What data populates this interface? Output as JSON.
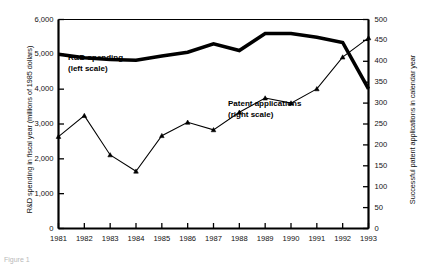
{
  "chart_data": {
    "type": "line",
    "title": "",
    "xlabel": "",
    "categories": [
      1981,
      1982,
      1983,
      1984,
      1985,
      1986,
      1987,
      1988,
      1989,
      1990,
      1991,
      1992,
      1993
    ],
    "tick_labels_x": [
      "1981",
      "1982",
      "1983",
      "1984",
      "1985",
      "1986",
      "1987",
      "1988",
      "1989",
      "1990",
      "1991",
      "1992",
      "1993"
    ],
    "grid": false,
    "legend_position": "inline-annotations",
    "axes": {
      "left": {
        "label": "R&D spending in fiscal year (millions of 1985 dollars)",
        "ylim": [
          0,
          6000
        ],
        "ticks": [
          0,
          1000,
          2000,
          3000,
          4000,
          5000,
          6000
        ],
        "tick_labels": [
          "0",
          "1,000",
          "2,000",
          "3,000",
          "4,000",
          "5,000",
          "6,000"
        ]
      },
      "right": {
        "label": "Successful patent applications in calendar year",
        "ylim": [
          0,
          500
        ],
        "ticks": [
          0,
          50,
          100,
          150,
          200,
          250,
          300,
          350,
          400,
          450,
          500
        ],
        "tick_labels": [
          "0",
          "50",
          "100",
          "150",
          "200",
          "250",
          "300",
          "350",
          "400",
          "450",
          "500"
        ]
      }
    },
    "series": [
      {
        "name": "R&D spending",
        "annotation": "R&D spending",
        "annotation_sub": "(left scale)",
        "axis": "left",
        "style": "thick-line",
        "markers": false,
        "color": "#000000",
        "values": [
          5000,
          4900,
          4850,
          4830,
          4950,
          5060,
          5300,
          5110,
          5600,
          5600,
          5490,
          5340,
          4010
        ]
      },
      {
        "name": "Patent applications",
        "annotation": "Patent applications",
        "annotation_sub": "(right scale)",
        "axis": "right",
        "style": "thin-line",
        "markers": true,
        "color": "#000000",
        "values": [
          220,
          270,
          176,
          137,
          222,
          254,
          236,
          278,
          312,
          300,
          334,
          410,
          456
        ]
      }
    ]
  },
  "caption": "Figure 1"
}
